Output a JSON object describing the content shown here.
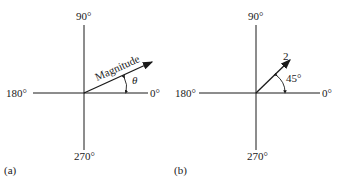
{
  "panel_a": {
    "caption": "(a)",
    "axis_labels": {
      "top": "90°",
      "left": "180°",
      "right": "0°",
      "bottom": "270°"
    },
    "vector_label": "Magnitude",
    "angle_label": "θ"
  },
  "panel_b": {
    "caption": "(b)",
    "axis_labels": {
      "top": "90°",
      "left": "180°",
      "right": "0°",
      "bottom": "270°"
    },
    "vector_label": "2",
    "angle_label": "45°"
  }
}
